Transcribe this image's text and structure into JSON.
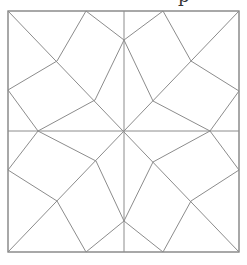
{
  "caption_fragment": "p",
  "diagram": {
    "type": "geometric-tiling",
    "colors": {
      "line": "#8c8c8c",
      "border": "#7a7a7a",
      "background": "#ffffff"
    },
    "square": {
      "x": 8,
      "y": 11,
      "width": 231,
      "height": 241
    },
    "center": [
      124,
      131
    ],
    "star_points": [
      [
        124,
        40
      ],
      [
        210,
        131
      ],
      [
        124,
        221
      ],
      [
        38,
        131
      ]
    ],
    "edges": [
      [
        [
          124,
          11
        ],
        [
          124,
          252
        ]
      ],
      [
        [
          8,
          131
        ],
        [
          239,
          131
        ]
      ],
      [
        [
          8,
          11
        ],
        [
          239,
          252
        ]
      ],
      [
        [
          239,
          11
        ],
        [
          8,
          252
        ]
      ],
      [
        [
          86,
          11
        ],
        [
          124,
          40
        ]
      ],
      [
        [
          163,
          11
        ],
        [
          124,
          40
        ]
      ],
      [
        [
          86,
          11
        ],
        [
          57,
          61
        ]
      ],
      [
        [
          57,
          61
        ],
        [
          8,
          90
        ]
      ],
      [
        [
          124,
          40
        ],
        [
          95,
          100
        ]
      ],
      [
        [
          95,
          100
        ],
        [
          38,
          131
        ]
      ],
      [
        [
          38,
          131
        ],
        [
          8,
          90
        ]
      ],
      [
        [
          163,
          11
        ],
        [
          191,
          61
        ]
      ],
      [
        [
          191,
          61
        ],
        [
          239,
          91
        ]
      ],
      [
        [
          124,
          40
        ],
        [
          153,
          101
        ]
      ],
      [
        [
          153,
          101
        ],
        [
          210,
          131
        ]
      ],
      [
        [
          210,
          131
        ],
        [
          239,
          91
        ]
      ],
      [
        [
          38,
          131
        ],
        [
          8,
          170
        ]
      ],
      [
        [
          8,
          170
        ],
        [
          57,
          201
        ]
      ],
      [
        [
          57,
          201
        ],
        [
          86,
          252
        ]
      ],
      [
        [
          38,
          131
        ],
        [
          96,
          161
        ]
      ],
      [
        [
          96,
          161
        ],
        [
          124,
          221
        ]
      ],
      [
        [
          124,
          221
        ],
        [
          86,
          252
        ]
      ],
      [
        [
          210,
          131
        ],
        [
          239,
          170
        ]
      ],
      [
        [
          239,
          170
        ],
        [
          191,
          201
        ]
      ],
      [
        [
          191,
          201
        ],
        [
          163,
          252
        ]
      ],
      [
        [
          210,
          131
        ],
        [
          153,
          162
        ]
      ],
      [
        [
          153,
          162
        ],
        [
          124,
          221
        ]
      ],
      [
        [
          124,
          221
        ],
        [
          163,
          252
        ]
      ]
    ]
  }
}
